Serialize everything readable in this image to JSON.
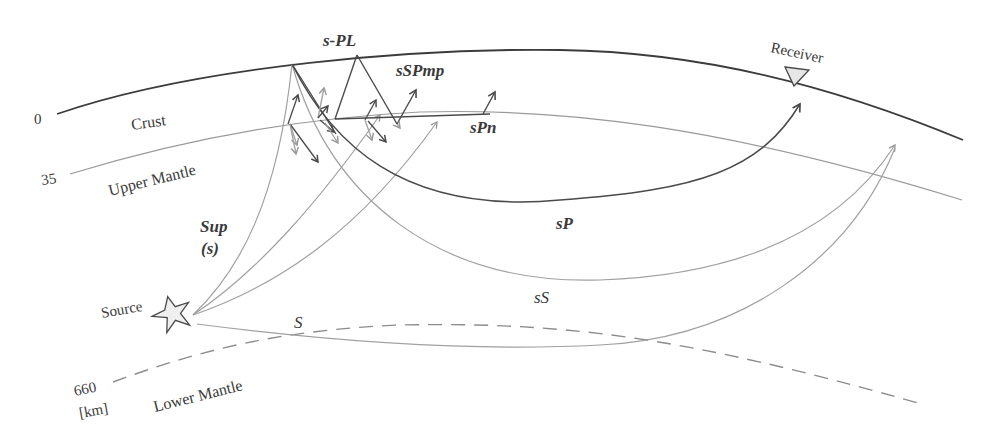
{
  "diagram": {
    "depth_labels": {
      "surface": "0",
      "moho": "35",
      "transition": "660",
      "unit": "[km]"
    },
    "layers": {
      "crust": "Crust",
      "upper_mantle": "Upper Mantle",
      "lower_mantle": "Lower Mantle"
    },
    "markers": {
      "source": "Source",
      "receiver": "Receiver"
    },
    "phases": {
      "s_pl": "s-PL",
      "sspmp": "sSPmp",
      "spn": "sPn",
      "sp": "sP",
      "ss": "sS",
      "s": "S",
      "sup": "Sup",
      "sup_sub": "(s)"
    },
    "colors": {
      "surface_line": "#3c3c3c",
      "moho_line": "#9a9a9a",
      "dark_ray": "#4a4a4a",
      "light_ray": "#a0a0a0",
      "dashed_660": "#8c8c8c",
      "receiver_fill": "#e6e6e6",
      "source_fill": "#efefef"
    }
  }
}
